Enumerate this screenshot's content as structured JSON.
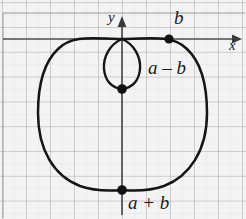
{
  "figure": {
    "kind": "polar-curve-graph",
    "title": "",
    "background_color": "#f2f2f2",
    "grid_major_color": "#9a9a9a",
    "grid_minor_color": "#d8d8d8",
    "axis_color": "#4a4a4a",
    "curve_color": "#1a1a1a",
    "point_color": "#111111"
  },
  "axes": {
    "x_label": "x",
    "y_label": "y",
    "x_arrow": "arrow-right",
    "y_arrow": "arrow-up"
  },
  "labels": {
    "b": "b",
    "a_minus_b": "a – b",
    "a_plus_b": "a + b"
  },
  "chart_data": {
    "type": "line",
    "title": "",
    "xlabel": "x",
    "ylabel": "y",
    "grid": true,
    "legend": null,
    "axis_origin_px": [
      122,
      39
    ],
    "grid_spacing_px": 24,
    "xlim": [
      -4.9,
      5.2
    ],
    "ylim": [
      -7.3,
      1.1
    ],
    "annotations": [
      {
        "text": "b",
        "at_px": [
          181,
          18
        ],
        "marks_point_px": [
          169,
          39
        ],
        "meaning": "inner-loop x-intercept"
      },
      {
        "text": "a – b",
        "at_px": [
          157,
          68
        ],
        "marks_point_px": [
          122,
          89
        ],
        "meaning": "inner loop extent"
      },
      {
        "text": "a + b",
        "at_px": [
          150,
          203
        ],
        "marks_point_px": [
          122,
          190
        ],
        "meaning": "outer loop extent"
      }
    ],
    "points": [
      {
        "name": "b-point",
        "px": [
          169,
          39
        ]
      },
      {
        "name": "a-minus-b-point",
        "px": [
          122,
          89
        ]
      },
      {
        "name": "a-plus-b-point",
        "px": [
          122,
          190
        ]
      },
      {
        "name": "origin-node",
        "px": [
          122,
          39
        ]
      }
    ],
    "series": [
      {
        "name": "outer-loop",
        "description": "limacon outer loop r = a + b sin(theta) (downward)",
        "path_px": "M 122 39 C 150 39 172 34 187 49 C 203 64 207 90 207 113 C 207 150 190 176 164 186 C 150 191 134 191 122 190 C 110 191 94 191 80 186 C 54 176 38 150 38 113 C 38 90 42 64 58 49 C 73 34 95 39 122 39 Z"
      },
      {
        "name": "inner-loop",
        "description": "limacon inner loop",
        "path_px": "M 122 39 C 134 44 141 57 140 69 C 139 81 132 88 122 89 C 112 88 105 81 104 69 C 103 57 110 44 122 39 Z"
      }
    ]
  }
}
